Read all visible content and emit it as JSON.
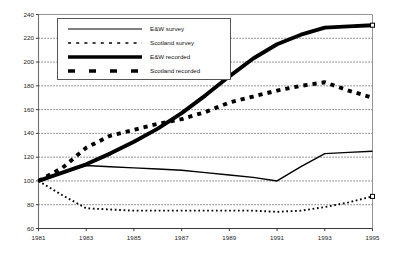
{
  "chart_data": {
    "type": "line",
    "title": "",
    "xlabel": "",
    "ylabel": "",
    "x": [
      1981,
      1982,
      1983,
      1984,
      1985,
      1986,
      1987,
      1988,
      1989,
      1990,
      1991,
      1992,
      1993,
      1994,
      1995
    ],
    "xlim": [
      1981,
      1995
    ],
    "ylim": [
      60,
      240
    ],
    "ytick_values": [
      60,
      80,
      100,
      120,
      140,
      160,
      180,
      200,
      220,
      240
    ],
    "ytick_labels": [
      "60",
      "80",
      "100",
      "120",
      "140",
      "160",
      "180",
      "200",
      "220",
      "240"
    ],
    "xtick_values": [
      1981,
      1983,
      1985,
      1987,
      1989,
      1991,
      1993,
      1995
    ],
    "xtick_labels": [
      "1981",
      "1983",
      "1985",
      "1987",
      "1989",
      "1991",
      "1993",
      "1995"
    ],
    "grid": "horizontal-dotted",
    "legend_position": "upper-left-inside",
    "series": [
      {
        "name": "E&W survey",
        "style": "thin-solid",
        "color": "#000000",
        "values": [
          100,
          107,
          113,
          112,
          111,
          110,
          109,
          107,
          105,
          103,
          100,
          112,
          123,
          124,
          125
        ]
      },
      {
        "name": "Scotland survey",
        "style": "thin-dotted",
        "color": "#000000",
        "values": [
          100,
          88,
          77,
          76,
          75,
          75,
          75,
          75,
          75,
          75,
          74,
          75,
          78,
          82,
          87
        ]
      },
      {
        "name": "E&W recorded",
        "style": "thick-solid",
        "color": "#000000",
        "values": [
          100,
          107,
          114,
          123,
          133,
          144,
          157,
          172,
          188,
          203,
          215,
          223,
          229,
          230,
          231
        ]
      },
      {
        "name": "Scotland recorded",
        "style": "thick-dashed",
        "color": "#000000",
        "values": [
          100,
          111,
          128,
          138,
          143,
          148,
          152,
          158,
          166,
          171,
          176,
          180,
          183,
          176,
          170
        ]
      }
    ]
  },
  "legend": {
    "entries": [
      {
        "label": "E&W survey"
      },
      {
        "label": "Scotland survey"
      },
      {
        "label": "E&W recorded"
      },
      {
        "label": "Scotland recorded"
      }
    ]
  }
}
